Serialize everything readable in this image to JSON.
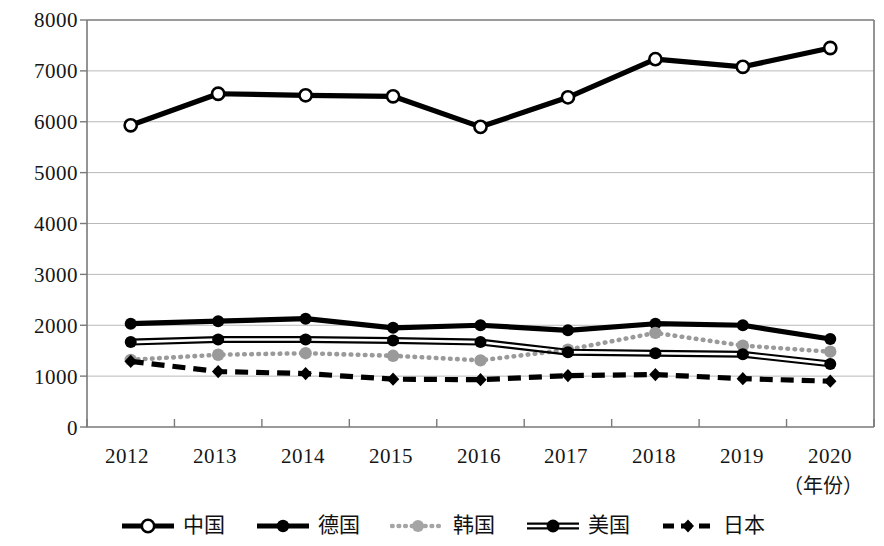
{
  "chart_data": {
    "type": "line",
    "title": "",
    "xlabel": "（年份）",
    "ylabel": "",
    "categories": [
      "2012",
      "2013",
      "2014",
      "2015",
      "2016",
      "2017",
      "2018",
      "2019",
      "2020"
    ],
    "ylim": [
      0,
      8000
    ],
    "yticks": [
      "0",
      "1000",
      "2000",
      "3000",
      "4000",
      "5000",
      "6000",
      "7000",
      "8000"
    ],
    "grid": true,
    "legend_position": "bottom",
    "series": [
      {
        "name": "中国",
        "marker": "open-circle",
        "line": "solid",
        "color": "#000000",
        "values": [
          5930,
          6550,
          6520,
          6500,
          5900,
          6480,
          7230,
          7080,
          7450
        ]
      },
      {
        "name": "德国",
        "marker": "filled-circle",
        "line": "solid",
        "color": "#000000",
        "values": [
          2030,
          2080,
          2130,
          1950,
          2000,
          1900,
          2030,
          2000,
          1730
        ]
      },
      {
        "name": "韩国",
        "marker": "filled-circle",
        "line": "dotted",
        "color": "#9a9a9a",
        "values": [
          1320,
          1420,
          1450,
          1400,
          1310,
          1520,
          1850,
          1600,
          1480
        ]
      },
      {
        "name": "美国",
        "marker": "filled-circle",
        "line": "solid-thin",
        "color": "#000000",
        "values": [
          1670,
          1720,
          1720,
          1700,
          1670,
          1470,
          1450,
          1430,
          1240
        ]
      },
      {
        "name": "日本",
        "marker": "filled-diamond",
        "line": "dashed",
        "color": "#000000",
        "values": [
          1290,
          1090,
          1050,
          940,
          930,
          1010,
          1030,
          950,
          900
        ]
      }
    ]
  },
  "legend": {
    "items": [
      {
        "label": "中国",
        "icon": "open-circle-line-marker"
      },
      {
        "label": "德国",
        "icon": "filled-circle-line-marker"
      },
      {
        "label": "韩国",
        "icon": "gray-dotted-circle-marker"
      },
      {
        "label": "美国",
        "icon": "filled-circle-double-line-marker"
      },
      {
        "label": "日本",
        "icon": "dashed-diamond-marker"
      }
    ]
  }
}
